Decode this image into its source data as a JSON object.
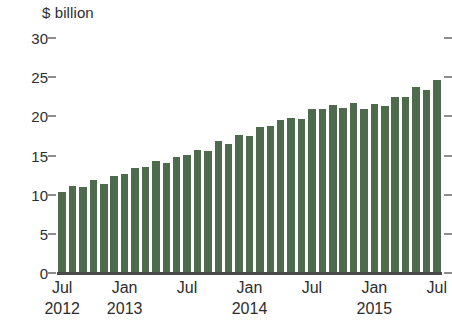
{
  "chart_data": {
    "type": "bar",
    "title": "",
    "subtitle": "",
    "xlabel": "",
    "ylabel": "$ billion",
    "unit_label": "$ billion",
    "ylim": [
      0,
      30
    ],
    "y_ticks": [
      0,
      5,
      10,
      15,
      20,
      25,
      30
    ],
    "y_tick_labels": [
      "0",
      "5",
      "10",
      "15",
      "20",
      "25",
      "30"
    ],
    "grid": false,
    "legend": null,
    "legend_position": "none",
    "series_color": "#4f6b4d",
    "axis_color": "#4a4a4a",
    "tick_color": "#8d8d8d",
    "x_axis_ticks": [
      {
        "month": "Jul",
        "year": "2012"
      },
      {
        "month": "Jan",
        "year": "2013"
      },
      {
        "month": "Jul",
        "year": ""
      },
      {
        "month": "Jan",
        "year": "2014"
      },
      {
        "month": "Jul",
        "year": ""
      },
      {
        "month": "Jan",
        "year": "2015"
      },
      {
        "month": "Jul",
        "year": ""
      }
    ],
    "x_start": "Jul 2012",
    "x_end": "Jul 2015",
    "frequency": "monthly",
    "categories": [
      "Jul 2012",
      "Aug 2012",
      "Sep 2012",
      "Oct 2012",
      "Nov 2012",
      "Dec 2012",
      "Jan 2013",
      "Feb 2013",
      "Mar 2013",
      "Apr 2013",
      "May 2013",
      "Jun 2013",
      "Jul 2013",
      "Aug 2013",
      "Sep 2013",
      "Oct 2013",
      "Nov 2013",
      "Dec 2013",
      "Jan 2014",
      "Feb 2014",
      "Mar 2014",
      "Apr 2014",
      "May 2014",
      "Jun 2014",
      "Jul 2014",
      "Aug 2014",
      "Sep 2014",
      "Oct 2014",
      "Nov 2014",
      "Dec 2014",
      "Jan 2015",
      "Feb 2015",
      "Mar 2015",
      "Apr 2015",
      "May 2015",
      "Jun 2015",
      "Jul 2015"
    ],
    "values": [
      10.4,
      11.1,
      11.0,
      11.9,
      11.4,
      12.4,
      12.7,
      13.4,
      13.5,
      14.3,
      14.1,
      14.8,
      15.1,
      15.7,
      15.6,
      16.8,
      16.5,
      17.6,
      17.5,
      18.7,
      18.8,
      19.5,
      19.8,
      19.7,
      21.0,
      20.9,
      21.4,
      21.1,
      21.7,
      20.9,
      21.6,
      21.3,
      22.5,
      22.5,
      23.8,
      23.3,
      24.6
    ]
  }
}
